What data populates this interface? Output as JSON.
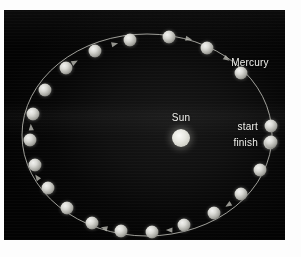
{
  "figure": {
    "background_color": "#0a0a0a",
    "border_color": "#fdfdfd",
    "labels": {
      "orbit_name": "Mercury",
      "star_name": "Sun",
      "start_marker": "start",
      "finish_marker": "finish"
    },
    "label_positions": [
      {
        "name": "mercury-label",
        "text": "Mercury",
        "x": 246,
        "y": 53,
        "align": "center"
      },
      {
        "name": "sun-label",
        "text": "Sun",
        "x": 177,
        "y": 108,
        "align": "center"
      },
      {
        "name": "start-label",
        "text": "start",
        "x": 254,
        "y": 117,
        "align": "right"
      },
      {
        "name": "finish-label",
        "text": "finish",
        "x": 254,
        "y": 133,
        "align": "right"
      }
    ],
    "sun": {
      "cx": 177,
      "cy": 128,
      "r": 9,
      "color": "#e4e4dc"
    },
    "orbit": {
      "shape": "ellipse",
      "center_x": 143,
      "center_y": 125,
      "radius_x": 125,
      "radius_y": 101,
      "stroke_color": "#b9b9b2",
      "stroke_width": 1,
      "direction": "clockwise"
    },
    "planet_radius": 6.5,
    "planet_color": "#d2d2cc",
    "planet_count": 18,
    "planets": [
      {
        "index": 1,
        "label": "start",
        "x": 267,
        "y": 116
      },
      {
        "index": 2,
        "label": "",
        "x": 266,
        "y": 133
      },
      {
        "index": 3,
        "label": "",
        "x": 256,
        "y": 160
      },
      {
        "index": 4,
        "label": "",
        "x": 237,
        "y": 184
      },
      {
        "index": 5,
        "label": "",
        "x": 210,
        "y": 203
      },
      {
        "index": 6,
        "label": "",
        "x": 180,
        "y": 215
      },
      {
        "index": 7,
        "label": "",
        "x": 148,
        "y": 222
      },
      {
        "index": 8,
        "label": "",
        "x": 117,
        "y": 221
      },
      {
        "index": 9,
        "label": "",
        "x": 88,
        "y": 213
      },
      {
        "index": 10,
        "label": "",
        "x": 63,
        "y": 198
      },
      {
        "index": 11,
        "label": "",
        "x": 44,
        "y": 178
      },
      {
        "index": 12,
        "label": "",
        "x": 31,
        "y": 155
      },
      {
        "index": 13,
        "label": "",
        "x": 26,
        "y": 130
      },
      {
        "index": 14,
        "label": "",
        "x": 29,
        "y": 104
      },
      {
        "index": 15,
        "label": "",
        "x": 41,
        "y": 80
      },
      {
        "index": 16,
        "label": "",
        "x": 62,
        "y": 58
      },
      {
        "index": 17,
        "label": "",
        "x": 91,
        "y": 41
      },
      {
        "index": 18,
        "label": "",
        "x": 126,
        "y": 30
      },
      {
        "index": 19,
        "label": "",
        "x": 165,
        "y": 27
      },
      {
        "index": 20,
        "label": "",
        "x": 203,
        "y": 38
      },
      {
        "index": 21,
        "label": "",
        "x": 237,
        "y": 63
      },
      {
        "index": 22,
        "label": "finish",
        "x": 267,
        "y": 132
      }
    ],
    "direction_arrows": [
      {
        "x": 71,
        "y": 52,
        "angle": -28
      },
      {
        "x": 111,
        "y": 34,
        "angle": -14
      },
      {
        "x": 185,
        "y": 29,
        "angle": 12
      },
      {
        "x": 223,
        "y": 49,
        "angle": 35
      },
      {
        "x": 27,
        "y": 117,
        "angle": -95
      },
      {
        "x": 33,
        "y": 167,
        "angle": -125
      },
      {
        "x": 100,
        "y": 218,
        "angle": 195
      },
      {
        "x": 165,
        "y": 220,
        "angle": 182
      },
      {
        "x": 224,
        "y": 195,
        "angle": 148
      }
    ]
  }
}
